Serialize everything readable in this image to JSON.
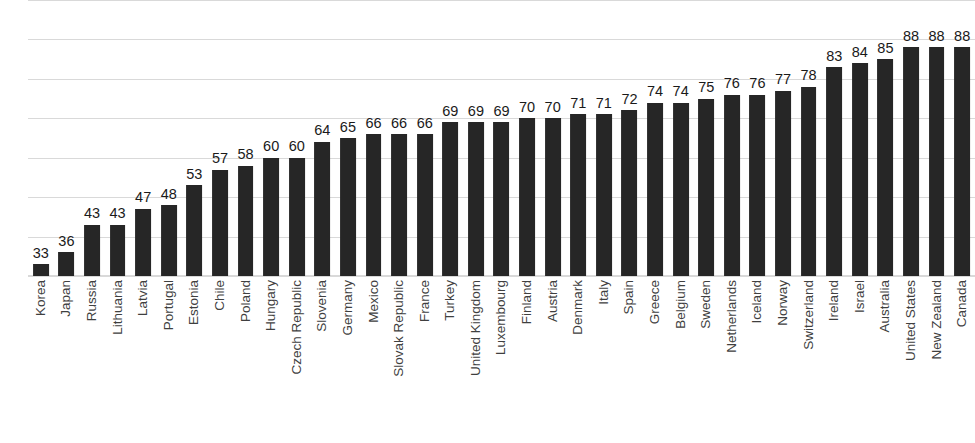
{
  "chart_data": {
    "type": "bar",
    "title": "",
    "subtitle": "",
    "xlabel": "",
    "ylabel": "",
    "ylim": [
      30,
      100
    ],
    "grid": true,
    "gridline_values": [
      100,
      90,
      80,
      70,
      60,
      50,
      40,
      30
    ],
    "legend": "none",
    "legend_position": "none",
    "bar_color": "#262626",
    "gridline_color": "#d9d9d9",
    "label_color": "#3f3f3f",
    "value_color": "#1a1a1a",
    "axis_tick_labels_visible": false,
    "data_labels_visible": true,
    "categories": [
      "Korea",
      "Japan",
      "Russia",
      "Lithuania",
      "Latvia",
      "Portugal",
      "Estonia",
      "Chile",
      "Poland",
      "Hungary",
      "Czech Republic",
      "Slovenia",
      "Germany",
      "Mexico",
      "Slovak Republic",
      "France",
      "Turkey",
      "United Kingdom",
      "Luxembourg",
      "Finland",
      "Austria",
      "Denmark",
      "Italy",
      "Spain",
      "Greece",
      "Belgium",
      "Sweden",
      "Netherlands",
      "Iceland",
      "Norway",
      "Switzerland",
      "Ireland",
      "Israel",
      "Australia",
      "United States",
      "New Zealand",
      "Canada"
    ],
    "values": [
      33,
      36,
      43,
      43,
      47,
      48,
      53,
      57,
      58,
      60,
      60,
      64,
      65,
      66,
      66,
      66,
      69,
      69,
      69,
      70,
      70,
      71,
      71,
      72,
      74,
      74,
      75,
      76,
      76,
      77,
      78,
      83,
      84,
      85,
      88,
      88,
      88
    ]
  }
}
